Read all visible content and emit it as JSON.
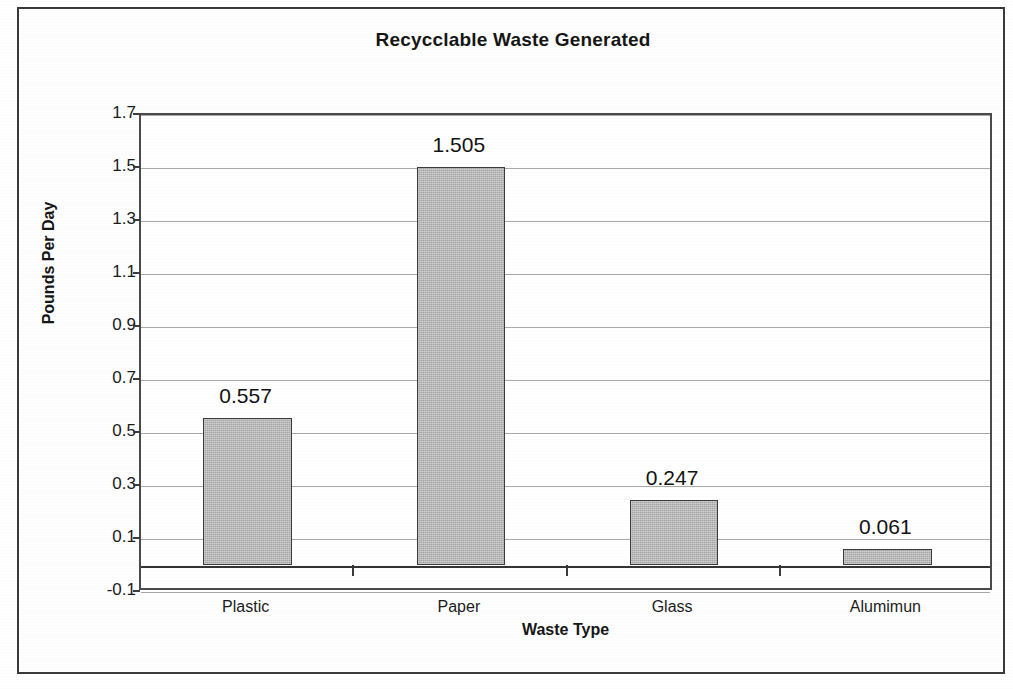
{
  "chart_data": {
    "type": "bar",
    "title": "Recycclable Waste Generated",
    "xlabel": "Waste Type",
    "ylabel": "Pounds Per Day",
    "categories": [
      "Plastic",
      "Paper",
      "Glass",
      "Alumimun"
    ],
    "values": [
      0.557,
      1.505,
      0.247,
      0.061
    ],
    "data_labels": [
      "0.557",
      "1.505",
      "0.247",
      "0.061"
    ],
    "ylim": [
      -0.1,
      1.7
    ],
    "ytick_step": 0.2,
    "ytick_labels": [
      "1.7",
      "1.5",
      "1.3",
      "1.1",
      "0.9",
      "0.7",
      "0.5",
      "0.3",
      "0.1",
      "-0.1"
    ],
    "ytick_values": [
      1.7,
      1.5,
      1.3,
      1.1,
      0.9,
      0.7,
      0.5,
      0.3,
      0.1,
      -0.1
    ],
    "grid": true,
    "grid_axis": "y",
    "legend": false,
    "legend_position": "none",
    "series": [
      {
        "name": "Pounds Per Day",
        "values": [
          0.557,
          1.505,
          0.247,
          0.061
        ]
      }
    ],
    "colors": {
      "bar_fill": "#b2b2b2",
      "bar_border": "#3b3b3b",
      "gridline": "#a9a9a9",
      "axis": "#343434",
      "text": "#161616",
      "background": "#ffffff",
      "frame_border": "#3a3a3a"
    }
  }
}
